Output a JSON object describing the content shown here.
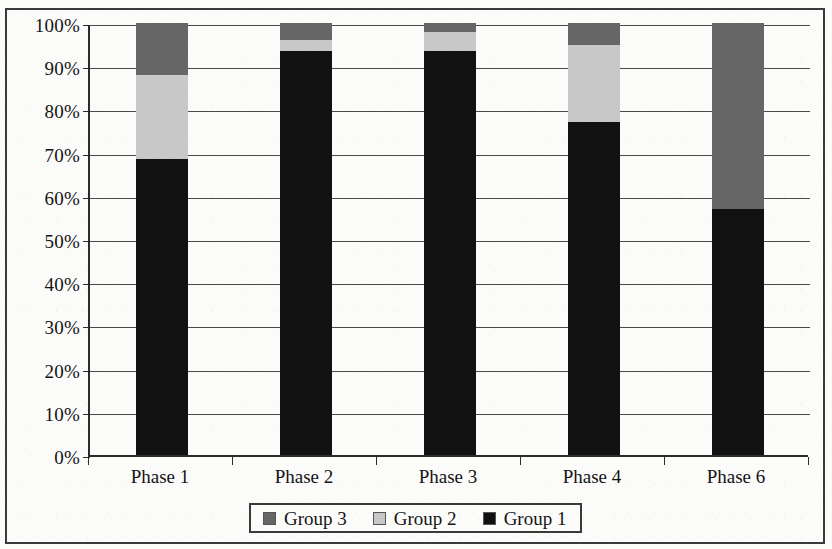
{
  "chart_data": {
    "type": "bar",
    "subtype": "stacked-100-percent",
    "title": "",
    "xlabel": "",
    "ylabel": "",
    "categories": [
      "Phase 1",
      "Phase 2",
      "Phase 3",
      "Phase 4",
      "Phase 6"
    ],
    "series": [
      {
        "name": "Group 1",
        "color": "#111111",
        "values": [
          68.5,
          93.5,
          93.5,
          77.0,
          57.0
        ]
      },
      {
        "name": "Group 2",
        "color": "#c8c8c8",
        "values": [
          19.5,
          2.5,
          4.5,
          18.0,
          0.0
        ]
      },
      {
        "name": "Group 3",
        "color": "#666666",
        "values": [
          12.0,
          4.0,
          2.0,
          5.0,
          43.0
        ]
      }
    ],
    "stack_order_bottom_to_top": [
      "Group 1",
      "Group 2",
      "Group 3"
    ],
    "ylim": [
      0,
      100
    ],
    "y_tick_labels": [
      "0%",
      "10%",
      "20%",
      "30%",
      "40%",
      "50%",
      "60%",
      "70%",
      "80%",
      "90%",
      "100%"
    ],
    "y_tick_values": [
      0,
      10,
      20,
      30,
      40,
      50,
      60,
      70,
      80,
      90,
      100
    ],
    "grid": true,
    "grid_axis": "y",
    "legend_position": "bottom-center",
    "legend_entries": [
      {
        "label": "Group 3",
        "color": "#666666"
      },
      {
        "label": "Group 2",
        "color": "#c8c8c8"
      },
      {
        "label": "Group 1",
        "color": "#111111"
      }
    ]
  },
  "figure": {
    "border_color": "#3a3a3a",
    "background": "#fbfbfa",
    "axis_color": "#2b2b2b"
  }
}
